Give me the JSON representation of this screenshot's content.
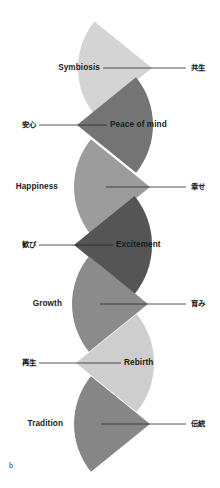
{
  "figure": {
    "panel_letter": "b",
    "background_color": "#ffffff",
    "width": 220,
    "height": 488
  },
  "chart_data": {
    "type": "diagram",
    "title": "",
    "subtitle": "",
    "xlabel": "",
    "ylabel": "",
    "legend_position": "none",
    "grid": false,
    "note": "Vertical stack of seven fan/cone wedge shapes, alternating apex direction, each annotated with an English concept label and its Japanese equivalent joined by a leader line.",
    "categories": [
      "Symbiosis",
      "Peace of mind",
      "Happiness",
      "Excitement",
      "Growth",
      "Rebirth",
      "Tradition"
    ],
    "series": [
      {
        "name": "wedge gray level (0=black,255=white)",
        "values": [
          212,
          116,
          156,
          85,
          139,
          206,
          134
        ]
      }
    ],
    "items": [
      {
        "index": 0,
        "label_en": "Symbiosis",
        "label_jp": "共生",
        "color": "#d4d4d4",
        "apex_side": "right",
        "apex_x": 152,
        "apex_y": 68,
        "radius": 74,
        "half_angle_deg": 39,
        "en_anchor_x": 100,
        "en_anchor_y": 68,
        "jp_anchor_x": 191,
        "jp_anchor_y": 68,
        "leader_from_x": 103,
        "leader_to_x": 186
      },
      {
        "index": 1,
        "label_en": "Peace of mind",
        "label_jp": "安心",
        "color": "#747474",
        "apex_side": "left",
        "apex_x": 77,
        "apex_y": 125,
        "radius": 76,
        "half_angle_deg": 39,
        "en_anchor_x": 110,
        "en_anchor_y": 125,
        "jp_anchor_x": 36,
        "jp_anchor_y": 125,
        "leader_from_x": 39,
        "leader_to_x": 107
      },
      {
        "index": 2,
        "label_en": "Happiness",
        "label_jp": "幸せ",
        "color": "#9c9c9c",
        "apex_side": "right",
        "apex_x": 150,
        "apex_y": 187,
        "radius": 76,
        "half_angle_deg": 39,
        "en_anchor_x": 58,
        "en_anchor_y": 187,
        "jp_anchor_x": 191,
        "jp_anchor_y": 187,
        "leader_from_x": 106,
        "leader_to_x": 186
      },
      {
        "index": 3,
        "label_en": "Excitement",
        "label_jp": "歓び",
        "color": "#555555",
        "apex_side": "left",
        "apex_x": 74,
        "apex_y": 245,
        "radius": 78,
        "half_angle_deg": 39,
        "en_anchor_x": 116,
        "en_anchor_y": 245,
        "jp_anchor_x": 36,
        "jp_anchor_y": 245,
        "leader_from_x": 39,
        "leader_to_x": 113
      },
      {
        "index": 4,
        "label_en": "Growth",
        "label_jp": "育み",
        "color": "#8b8b8b",
        "apex_side": "right",
        "apex_x": 148,
        "apex_y": 304,
        "radius": 76,
        "half_angle_deg": 39,
        "en_anchor_x": 62,
        "en_anchor_y": 304,
        "jp_anchor_x": 191,
        "jp_anchor_y": 304,
        "leader_from_x": 100,
        "leader_to_x": 186
      },
      {
        "index": 5,
        "label_en": "Rebirth",
        "label_jp": "再生",
        "color": "#cecece",
        "apex_side": "left",
        "apex_x": 76,
        "apex_y": 363,
        "radius": 78,
        "half_angle_deg": 39,
        "en_anchor_x": 124,
        "en_anchor_y": 363,
        "jp_anchor_x": 36,
        "jp_anchor_y": 363,
        "leader_from_x": 39,
        "leader_to_x": 121
      },
      {
        "index": 6,
        "label_en": "Tradition",
        "label_jp": "伝統",
        "color": "#868686",
        "apex_side": "right",
        "apex_x": 150,
        "apex_y": 424,
        "radius": 76,
        "half_angle_deg": 39,
        "en_anchor_x": 63,
        "en_anchor_y": 424,
        "jp_anchor_x": 191,
        "jp_anchor_y": 424,
        "leader_from_x": 101,
        "leader_to_x": 186
      }
    ],
    "leader_line_color": "#2a2a2a"
  }
}
